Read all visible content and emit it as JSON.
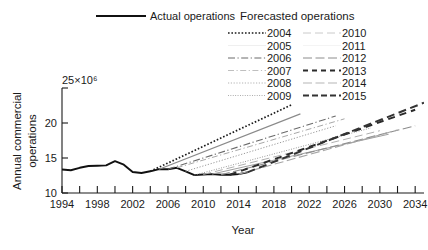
{
  "chart_data": {
    "type": "line",
    "title": "",
    "xlabel": "Year",
    "ylabel": "Annual commercial operations",
    "y_exponent_label": "25×10⁶",
    "xlim": [
      1994,
      2035
    ],
    "ylim": [
      10,
      25
    ],
    "xticks": [
      1994,
      1998,
      2002,
      2006,
      2010,
      2014,
      2018,
      2022,
      2026,
      2030,
      2034
    ],
    "xtick_labels": [
      "1994",
      "1998",
      "2002",
      "2006",
      "2010",
      "2014",
      "2018",
      "2022",
      "2026",
      "2030",
      "2034"
    ],
    "xticks_minor": [
      1996,
      2000,
      2004,
      2008,
      2012,
      2016,
      2020,
      2024,
      2028,
      2032
    ],
    "yticks": [
      10,
      15,
      20,
      25
    ],
    "ytick_labels": [
      "10",
      "15",
      "20",
      "25"
    ],
    "grid": false,
    "legend_position": "top",
    "units": "operations per year (millions)",
    "series": [
      {
        "name": "Actual operations",
        "style": "solid",
        "width": 1.9,
        "color": "#111111",
        "x": [
          1994,
          1995,
          1996,
          1997,
          1998,
          1999,
          2000,
          2001,
          2002,
          2003,
          2004,
          2005,
          2006,
          2007,
          2008,
          2009,
          2010,
          2011,
          2012,
          2013,
          2014,
          2015
        ],
        "values": [
          13.35,
          13.25,
          13.6,
          13.85,
          13.9,
          13.95,
          14.55,
          14.05,
          13.0,
          12.85,
          13.1,
          13.4,
          13.4,
          13.6,
          13.1,
          12.55,
          12.65,
          12.7,
          12.6,
          12.6,
          12.7,
          12.95
        ]
      },
      {
        "name": "2004",
        "style": "dotted-coarse",
        "width": 1.7,
        "color": "#1a1a1a",
        "x": [
          2004,
          2020
        ],
        "values": [
          13.1,
          22.6
        ]
      },
      {
        "name": "2005",
        "style": "none",
        "width": 1.2,
        "color": "#8a8a8a",
        "x": [
          2005,
          2021
        ],
        "values": [
          13.4,
          21.3
        ]
      },
      {
        "name": "2006",
        "style": "dashdot",
        "width": 1.1,
        "color": "#6b6b6b",
        "x": [
          2006,
          2025
        ],
        "values": [
          13.4,
          21.0
        ]
      },
      {
        "name": "2007",
        "style": "dashdot-light",
        "width": 1.0,
        "color": "#a8a8a8",
        "x": [
          2007,
          2026
        ],
        "values": [
          13.6,
          20.6
        ]
      },
      {
        "name": "2008",
        "style": "dotted-fine",
        "width": 1.0,
        "color": "#9a9a9a",
        "x": [
          2008,
          2025
        ],
        "values": [
          13.1,
          19.6
        ]
      },
      {
        "name": "2009",
        "style": "dotted-fine2",
        "width": 1.0,
        "color": "#8f8f8f",
        "x": [
          2009,
          2029
        ],
        "values": [
          12.55,
          19.3
        ]
      },
      {
        "name": "2010",
        "style": "dashed-long-light",
        "width": 1.0,
        "color": "#b0b0b0",
        "x": [
          2010,
          2030
        ],
        "values": [
          12.65,
          18.9
        ]
      },
      {
        "name": "2011",
        "style": "none",
        "width": 1.0,
        "color": "#9f9f9f",
        "x": [
          2011,
          2031
        ],
        "values": [
          12.7,
          18.4
        ]
      },
      {
        "name": "2012",
        "style": "dashed-long",
        "width": 1.1,
        "color": "#8c8c8c",
        "x": [
          2012,
          2034
        ],
        "values": [
          12.6,
          19.6
        ]
      },
      {
        "name": "2013",
        "style": "dashed-bold",
        "width": 2.0,
        "color": "#2b2b2b",
        "x": [
          2013,
          2034
        ],
        "values": [
          12.6,
          21.9
        ]
      },
      {
        "name": "2014",
        "style": "dashed-light",
        "width": 1.1,
        "color": "#a5a5a5",
        "x": [
          2014,
          2032
        ],
        "values": [
          12.7,
          19.0
        ]
      },
      {
        "name": "2015",
        "style": "dashed-bold2",
        "width": 2.0,
        "color": "#333333",
        "x": [
          2015,
          2035
        ],
        "values": [
          12.95,
          22.9
        ]
      }
    ]
  },
  "legend": {
    "actual": {
      "label": "Actual operations"
    },
    "forecast_header": "Forecasted operations",
    "col_left": [
      {
        "label": "2004"
      },
      {
        "label": "2005"
      },
      {
        "label": "2006"
      },
      {
        "label": "2007"
      },
      {
        "label": "2008"
      },
      {
        "label": "2009"
      }
    ],
    "col_right": [
      {
        "label": "2010"
      },
      {
        "label": "2011"
      },
      {
        "label": "2012"
      },
      {
        "label": "2013"
      },
      {
        "label": "2014"
      },
      {
        "label": "2015"
      }
    ]
  },
  "axes": {
    "y_title_line1": "Annual commercial",
    "y_title_line2": "operations",
    "y_exponent": "25×10⁶",
    "x_title": "Year"
  }
}
